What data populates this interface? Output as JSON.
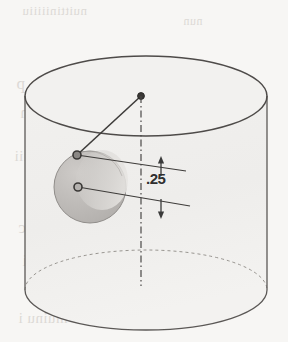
{
  "page": {
    "kind": "scanned-textbook-figure",
    "width": 288,
    "height": 342,
    "paper_color": "#f7f6f4",
    "ink_color": "#555252"
  },
  "figure": {
    "cylinder": {
      "name": "transparent-cylinder",
      "top_ellipse": {
        "cx": 146,
        "cy": 96,
        "rx": 121,
        "ry": 40
      },
      "bottom_ellipse": {
        "cx": 146,
        "cy": 290,
        "rx": 121,
        "ry": 40
      },
      "left_wall_x": 25,
      "right_wall_x": 267,
      "stroke": "#5b5856",
      "fill": "#f2f1ef"
    },
    "sphere": {
      "name": "shaded-sphere",
      "cx": 90,
      "cy": 187,
      "r": 36,
      "fill_dark": "#b9b7b4",
      "fill_light": "#d8d6d3",
      "stroke": "#8d8a87"
    },
    "markers": [
      {
        "name": "apex-point",
        "x": 141,
        "y": 96,
        "style": "filled-dot"
      },
      {
        "name": "sphere-top-point",
        "x": 77,
        "y": 155,
        "style": "filled-dot"
      },
      {
        "name": "sphere-center-point",
        "x": 78,
        "y": 187,
        "style": "open-dot"
      }
    ],
    "leader_lines": [
      {
        "name": "radius-leader",
        "x1": 141,
        "y1": 96,
        "x2": 77,
        "y2": 155
      },
      {
        "name": "upper-extension-line",
        "x1": 77,
        "y1": 155,
        "x2": 186,
        "y2": 171
      },
      {
        "name": "lower-extension-line",
        "x1": 78,
        "y1": 187,
        "x2": 190,
        "y2": 206
      }
    ],
    "centerline": {
      "name": "vertical-centerline",
      "x": 141,
      "y1": 96,
      "y2": 286,
      "style": "dash-dot"
    },
    "dimension": {
      "name": "vertical-dimension",
      "label": ".25",
      "label_x": 146,
      "label_y": 178,
      "arrow_x": 161,
      "top_arrow_y": 163,
      "bottom_arrow_y": 212,
      "arrow_direction": "outward"
    }
  },
  "bleed_through": [
    {
      "text": "nuittiniiiiiu",
      "x": 22,
      "y": 3,
      "size": 13
    },
    {
      "text": "nun",
      "x": 183,
      "y": 14,
      "size": 12
    },
    {
      "text": "Gen xoti a p",
      "x": 16,
      "y": 74,
      "size": 17
    },
    {
      "text": "iiniiiiiiion",
      "x": 20,
      "y": 104,
      "size": 16
    },
    {
      "text": "iiniiiiii",
      "x": 14,
      "y": 148,
      "size": 15
    },
    {
      "text": "tic onc c",
      "x": 18,
      "y": 218,
      "size": 17
    },
    {
      "text": "c c ci",
      "x": 22,
      "y": 252,
      "size": 16
    },
    {
      "text": "i muinu i",
      "x": 18,
      "y": 310,
      "size": 15
    }
  ]
}
